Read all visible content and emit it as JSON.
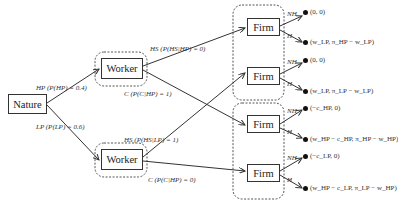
{
  "nodes": {
    "nature": "Nature",
    "worker_hp": "Worker",
    "worker_lp": "Worker",
    "firm_1": "Firm",
    "firm_2": "Firm",
    "firm_3": "Firm",
    "firm_4": "Firm"
  },
  "edges": {
    "hp": "HP (P(HP) = 0.4)",
    "lp": "LP (P(LP) = 0.6)",
    "hs_hp": "HS (P(HS|HP) = 0)",
    "c_hp": "C (P(C|HP) = 1)",
    "hs_lp": "HS (P(HS|LP) = 1)",
    "c_lp": "C (P(C|HP) = 0)",
    "firm_1_nh": "NH",
    "firm_1_h": "H",
    "firm_2_nh": "NH",
    "firm_2_h": "H",
    "firm_3_nh": "NH",
    "firm_3_h": "H",
    "firm_4_nh": "NH",
    "firm_4_h": "H"
  },
  "payoffs": [
    "(0, 0)",
    "(w_LP, π_HP − w_LP)",
    "(0, 0)",
    "(w_LP, π_LP − w_LP)",
    "(−c_HP, 0)",
    "(w_HP − c_HP, π_HP − w_HP)",
    "(−c_LP, 0)",
    "(w_HP − c_LP, π_LP − w_HP)"
  ],
  "colors": {
    "line": "#333333",
    "dashed": "#555555"
  }
}
